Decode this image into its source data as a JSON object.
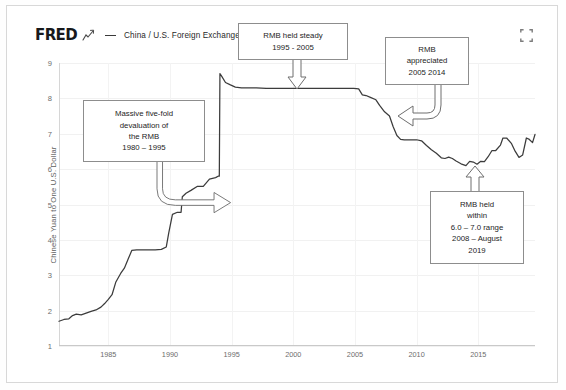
{
  "header": {
    "logo": "FRED",
    "logo_icon": "fred-squiggle-icon",
    "series_label": "China / U.S. Foreign Exchange Rate",
    "expand_icon": "expand-fullscreen-icon"
  },
  "annotations": [
    {
      "id": "devaluation",
      "lines": [
        "Massive five-fold",
        "devaluation of",
        "the RMB",
        "1980 – 1995"
      ],
      "arrow": "curved-arrow-right"
    },
    {
      "id": "steady",
      "lines": [
        "RMB held steady",
        "1995 - 2005"
      ],
      "arrow": "hollow-arrow-down"
    },
    {
      "id": "appreciated",
      "lines": [
        "RMB",
        "appreciated",
        "2005 2014"
      ],
      "arrow": "curved-arrow-left"
    },
    {
      "id": "range",
      "lines": [
        "RMB held",
        "within",
        "6.0 – 7.0 range",
        "2008 – August",
        "2019"
      ],
      "arrow": "hollow-arrow-up"
    }
  ],
  "chart_data": {
    "type": "line",
    "title": "China / U.S. Foreign Exchange Rate",
    "xlabel": "",
    "ylabel": "Chinese Yuan to One U.S. Dollar",
    "xlim": [
      1981,
      2019.6
    ],
    "ylim": [
      1,
      9
    ],
    "xticks": [
      "1985",
      "1990",
      "1995",
      "2000",
      "2005",
      "2010",
      "2015"
    ],
    "xtick_values": [
      1985,
      1990,
      1995,
      2000,
      2005,
      2010,
      2015
    ],
    "yticks": [
      "1",
      "2",
      "3",
      "4",
      "5",
      "6",
      "7",
      "8",
      "9"
    ],
    "ytick_values": [
      1,
      2,
      3,
      4,
      5,
      6,
      7,
      8,
      9
    ],
    "grid": true,
    "legend": "China / U.S. Foreign Exchange Rate",
    "legend_position": "top-left",
    "line_color": "#3c3c3c",
    "series": [
      {
        "name": "China / U.S. Foreign Exchange Rate",
        "x": [
          1981.0,
          1981.4,
          1981.8,
          1982.1,
          1982.4,
          1982.8,
          1983.2,
          1983.6,
          1984.0,
          1984.4,
          1984.7,
          1985.0,
          1985.3,
          1985.6,
          1986.0,
          1986.3,
          1986.6,
          1986.9,
          1987.3,
          1987.8,
          1988.3,
          1988.8,
          1989.3,
          1989.7,
          1989.9,
          1990.2,
          1990.6,
          1990.9,
          1991.0,
          1991.3,
          1991.7,
          1992.2,
          1992.7,
          1993.2,
          1993.7,
          1993.9,
          1994.0,
          1994.05,
          1994.2,
          1994.5,
          1994.9,
          1995.3,
          1995.8,
          1996.4,
          1997.0,
          1997.8,
          1998.6,
          1999.5,
          2000.4,
          2001.3,
          2002.2,
          2003.1,
          2004.0,
          2004.9,
          2005.3,
          2005.6,
          2005.9,
          2006.3,
          2006.7,
          2007.0,
          2007.4,
          2007.8,
          2008.1,
          2008.4,
          2008.7,
          2009.0,
          2009.5,
          2010.0,
          2010.4,
          2010.8,
          2011.2,
          2011.6,
          2012.0,
          2012.3,
          2012.6,
          2012.9,
          2013.2,
          2013.6,
          2014.0,
          2014.3,
          2014.6,
          2014.9,
          2015.2,
          2015.5,
          2015.8,
          2016.1,
          2016.4,
          2016.8,
          2017.0,
          2017.3,
          2017.7,
          2018.0,
          2018.3,
          2018.6,
          2018.9,
          2019.1,
          2019.4,
          2019.6
        ],
        "y": [
          1.7,
          1.75,
          1.77,
          1.86,
          1.9,
          1.88,
          1.93,
          1.98,
          2.02,
          2.1,
          2.2,
          2.32,
          2.45,
          2.8,
          3.05,
          3.2,
          3.45,
          3.7,
          3.72,
          3.72,
          3.72,
          3.72,
          3.73,
          3.8,
          4.2,
          4.72,
          4.78,
          4.78,
          5.22,
          5.32,
          5.4,
          5.51,
          5.51,
          5.72,
          5.76,
          5.8,
          5.8,
          8.7,
          8.62,
          8.45,
          8.38,
          8.32,
          8.3,
          8.3,
          8.3,
          8.28,
          8.28,
          8.28,
          8.28,
          8.28,
          8.28,
          8.28,
          8.28,
          8.28,
          8.27,
          8.1,
          8.08,
          8.02,
          7.96,
          7.8,
          7.62,
          7.5,
          7.2,
          6.95,
          6.84,
          6.83,
          6.83,
          6.83,
          6.8,
          6.67,
          6.55,
          6.45,
          6.32,
          6.3,
          6.34,
          6.3,
          6.23,
          6.15,
          6.1,
          6.22,
          6.2,
          6.14,
          6.22,
          6.21,
          6.35,
          6.52,
          6.52,
          6.68,
          6.88,
          6.88,
          6.72,
          6.5,
          6.33,
          6.4,
          6.88,
          6.85,
          6.75,
          6.98
        ]
      }
    ]
  }
}
